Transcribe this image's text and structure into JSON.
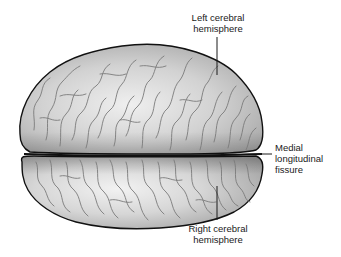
{
  "diagram": {
    "colors": {
      "outline": "#111111",
      "gyri": "#7a7a7a",
      "fill_light": "#ececec",
      "fill_mid": "#c4c4c4",
      "fill_dark": "#9a9a9a",
      "leader": "#1a1a1a"
    },
    "labels": {
      "left_hemisphere": {
        "line1": "Left cerebral",
        "line2": "hemisphere"
      },
      "fissure": {
        "line1": "Medial",
        "line2": "longitudinal",
        "line3": "fissure"
      },
      "right_hemisphere": {
        "line1": "Right cerebral",
        "line2": "hemisphere"
      }
    }
  }
}
